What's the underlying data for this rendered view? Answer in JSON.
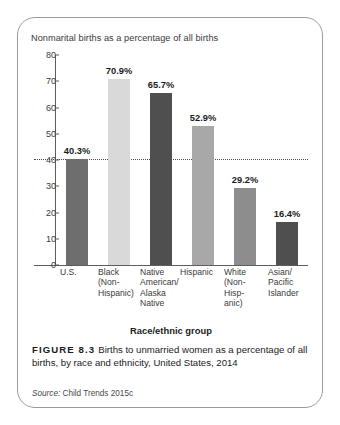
{
  "figure": {
    "number_label": "FIGURE 8.3",
    "caption_text": "Births to unmarried women as a percentage of all births, by race and ethnicity, United States, 2014",
    "source_word": "Source:",
    "source_text": "Child Trends 2015c"
  },
  "chart_data": {
    "type": "bar",
    "title": "Nonmarital births as a percentage of all births",
    "xlabel": "Race/ethnic group",
    "ylabel": "",
    "ylim": [
      0,
      80
    ],
    "yticks": [
      0,
      10,
      20,
      30,
      40,
      50,
      60,
      70,
      80
    ],
    "ytick_labels": [
      "0",
      "10",
      "20",
      "30",
      "40",
      "50",
      "60",
      "70",
      "80"
    ],
    "grid": false,
    "legend": "none",
    "reference_line": {
      "value": 40.3,
      "style": "dotted",
      "color": "#4a4a4a"
    },
    "categories": [
      "U.S.",
      "Black (Non-Hispanic)",
      "Native American/ Alaska Native",
      "Hispanic",
      "White (Non-Hispanic)",
      "Asian/ Pacific Islander"
    ],
    "category_label_lines": [
      [
        "U.S."
      ],
      [
        "Black",
        "(Non-",
        "Hispanic)"
      ],
      [
        "Native",
        "American/",
        "Alaska",
        "Native"
      ],
      [
        "Hispanic"
      ],
      [
        "White",
        "(Non-",
        "Hisp-",
        "anic)"
      ],
      [
        "Asian/",
        "Pacific",
        "Islander"
      ]
    ],
    "values": [
      40.3,
      70.9,
      65.7,
      52.9,
      29.2,
      16.4
    ],
    "value_labels": [
      "40.3%",
      "70.9%",
      "65.7%",
      "52.9%",
      "29.2%",
      "16.4%"
    ],
    "bar_colors": [
      "#6e6e6e",
      "#d9d9d9",
      "#4f4f4f",
      "#a8a8a8",
      "#8d8d8d",
      "#4f4f4f"
    ]
  }
}
